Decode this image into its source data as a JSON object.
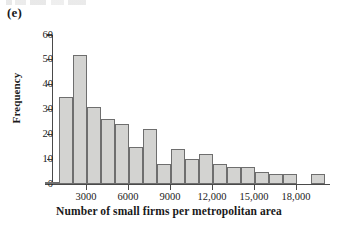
{
  "figure": {
    "panel_label": "(e)"
  },
  "chart_data": {
    "type": "bar",
    "title": "",
    "subtitle": "",
    "xlabel": "Number of small firms per metropolitan area",
    "ylabel": "Frequency",
    "grid": false,
    "legend": null,
    "ylim": [
      0,
      60
    ],
    "ytick_labels": [
      "0",
      "10",
      "20",
      "30",
      "40",
      "50",
      "60"
    ],
    "ytick_values": [
      0,
      10,
      20,
      30,
      40,
      50,
      60
    ],
    "xlim": [
      0,
      19500
    ],
    "xtick_labels": [
      "3000",
      "6000",
      "9000",
      "12,000",
      "15,000",
      "18,000"
    ],
    "xtick_values": [
      3000,
      6000,
      9000,
      12000,
      15000,
      18000
    ],
    "bin_width": 750,
    "bin_starts": [
      750,
      1500,
      2250,
      3000,
      3750,
      4500,
      5250,
      6000,
      6750,
      7500,
      8250,
      9000,
      9750,
      10500,
      11250,
      12000,
      12750,
      13500,
      14250,
      15000,
      15750,
      18000
    ],
    "categories": [
      "750",
      "1500",
      "2250",
      "3000",
      "3750",
      "4500",
      "5250",
      "6000",
      "6750",
      "7500",
      "8250",
      "9000",
      "9750",
      "10500",
      "11250",
      "12000",
      "12750",
      "13500",
      "14250",
      "15000",
      "15750",
      "18000"
    ],
    "values": [
      1,
      35,
      52,
      31,
      26,
      24,
      15,
      22,
      8,
      14,
      10,
      12,
      8,
      7,
      7,
      5,
      4,
      4,
      4,
      0,
      0,
      4
    ]
  },
  "bars": [
    {
      "x": 45.0,
      "width": 14.0,
      "value": 1
    },
    {
      "x": 59.0,
      "width": 14.0,
      "value": 35
    },
    {
      "x": 73.0,
      "width": 14.0,
      "value": 52
    },
    {
      "x": 87.0,
      "width": 14.0,
      "value": 31
    },
    {
      "x": 101.0,
      "width": 14.0,
      "value": 26
    },
    {
      "x": 115.0,
      "width": 14.0,
      "value": 24
    },
    {
      "x": 129.0,
      "width": 14.0,
      "value": 15
    },
    {
      "x": 143.0,
      "width": 14.0,
      "value": 22
    },
    {
      "x": 157.0,
      "width": 14.0,
      "value": 8
    },
    {
      "x": 171.0,
      "width": 14.0,
      "value": 14
    },
    {
      "x": 185.0,
      "width": 14.0,
      "value": 10
    },
    {
      "x": 199.0,
      "width": 14.0,
      "value": 12
    },
    {
      "x": 213.0,
      "width": 14.0,
      "value": 8
    },
    {
      "x": 227.0,
      "width": 14.0,
      "value": 7
    },
    {
      "x": 241.0,
      "width": 14.0,
      "value": 7
    },
    {
      "x": 255.0,
      "width": 14.0,
      "value": 5
    },
    {
      "x": 269.0,
      "width": 14.0,
      "value": 4
    },
    {
      "x": 283.0,
      "width": 14.0,
      "value": 4
    },
    {
      "x": 311.0,
      "width": 14.0,
      "value": 4
    }
  ],
  "geometry": {
    "y_zero_px": 184,
    "px_per_unit": 2.483,
    "x_tick_px": [
      86,
      128,
      170,
      212,
      254,
      296
    ]
  },
  "colors": {
    "bar_fill": "#d3d3d1",
    "bar_stroke": "#6e6e6e",
    "axis": "#4a4a4a",
    "text": "#1a1a1a",
    "background": "#ffffff"
  }
}
